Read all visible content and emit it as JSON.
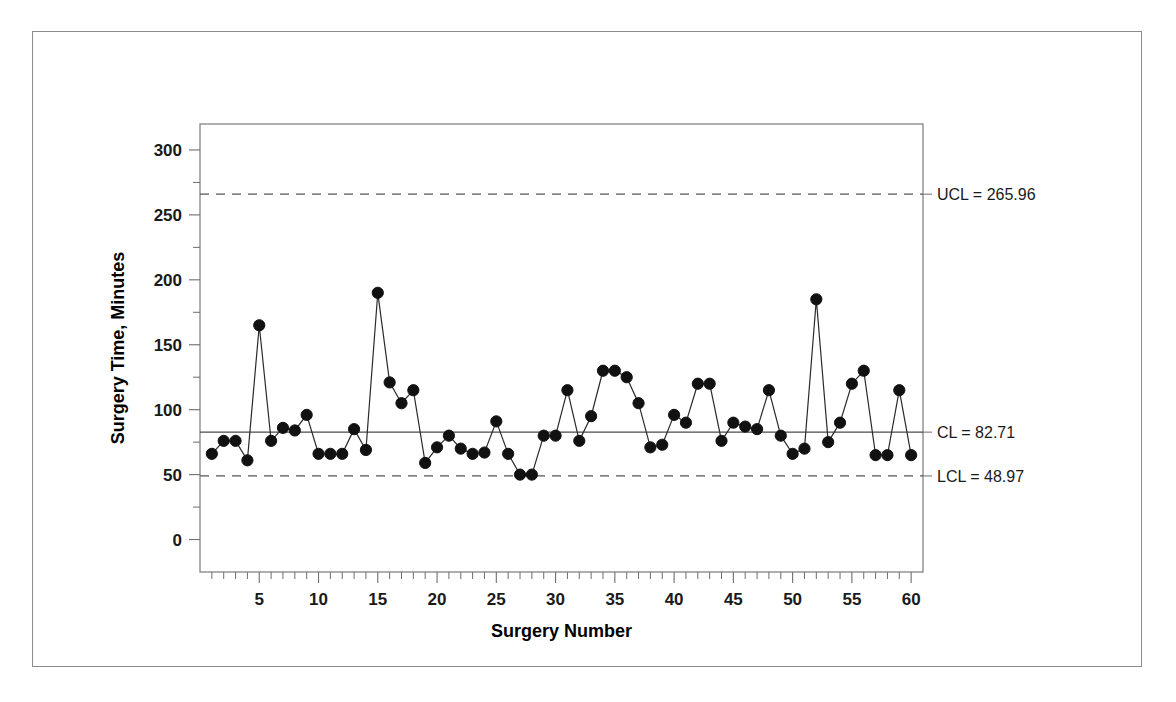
{
  "chart_data": {
    "type": "line",
    "title": "",
    "xlabel": "Surgery Number",
    "ylabel": "Surgery Time, Minutes",
    "xlim": [
      0,
      61
    ],
    "ylim": [
      -25,
      320
    ],
    "grid": false,
    "legend": "none",
    "x_tick_labels": [
      "5",
      "10",
      "15",
      "20",
      "25",
      "30",
      "35",
      "40",
      "45",
      "50",
      "55",
      "60"
    ],
    "x_tick_values": [
      5,
      10,
      15,
      20,
      25,
      30,
      35,
      40,
      45,
      50,
      55,
      60
    ],
    "x_minor_tick_step": 1,
    "y_tick_labels": [
      "0",
      "50",
      "100",
      "150",
      "200",
      "250",
      "300"
    ],
    "y_tick_values": [
      0,
      50,
      100,
      150,
      200,
      250,
      300
    ],
    "x": [
      1,
      2,
      3,
      4,
      5,
      6,
      7,
      8,
      9,
      10,
      11,
      12,
      13,
      14,
      15,
      16,
      17,
      18,
      19,
      20,
      21,
      22,
      23,
      24,
      25,
      26,
      27,
      28,
      29,
      30,
      31,
      32,
      33,
      34,
      35,
      36,
      37,
      38,
      39,
      40,
      41,
      42,
      43,
      44,
      45,
      46,
      47,
      48,
      49,
      50,
      51,
      52,
      53,
      54,
      55,
      56,
      57,
      58,
      59,
      60
    ],
    "series": [
      {
        "name": "Surgery Time",
        "marker": "filled-circle",
        "values": [
          66,
          76,
          76,
          61,
          165,
          76,
          86,
          84,
          96,
          66,
          66,
          66,
          85,
          69,
          190,
          121,
          105,
          115,
          59,
          71,
          80,
          70,
          66,
          67,
          91,
          66,
          50,
          50,
          80,
          80,
          115,
          76,
          95,
          130,
          130,
          125,
          105,
          71,
          73,
          96,
          90,
          120,
          120,
          76,
          90,
          87,
          85,
          115,
          80,
          66,
          70,
          185,
          75,
          90,
          120,
          130,
          65,
          65,
          115,
          65
        ]
      }
    ],
    "control_limits": {
      "ucl": {
        "label": "UCL = 265.96",
        "value": 265.96,
        "style": "dashed"
      },
      "cl": {
        "label": "CL = 82.71",
        "value": 82.71,
        "style": "solid"
      },
      "lcl": {
        "label": "LCL = 48.97",
        "value": 48.97,
        "style": "dashed"
      }
    }
  }
}
